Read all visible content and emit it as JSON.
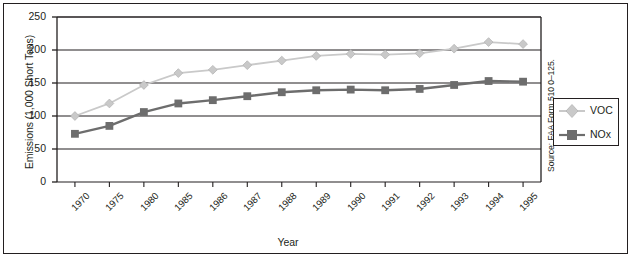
{
  "chart_data": {
    "type": "line",
    "title": "",
    "xlabel": "Year",
    "ylabel": "Emissions (1,000 Short Tons)",
    "categories": [
      "1970",
      "1975",
      "1980",
      "1985",
      "1986",
      "1987",
      "1988",
      "1989",
      "1990",
      "1991",
      "1992",
      "1993",
      "1994",
      "1995"
    ],
    "ylim": [
      0,
      250
    ],
    "yticks": [
      0,
      50,
      100,
      150,
      200,
      250
    ],
    "ytick_labels": [
      "0",
      "50",
      "100",
      "150",
      "200",
      "250"
    ],
    "grid": "horizontal",
    "legend_position": "right-outside",
    "series": [
      {
        "name": "VOC",
        "color": "#c9c9c9",
        "marker": "diamond",
        "values": [
          100,
          119,
          147,
          165,
          170,
          177,
          184,
          191,
          194,
          193,
          195,
          202,
          212,
          209
        ]
      },
      {
        "name": "NOx",
        "color": "#6d6d6d",
        "marker": "square",
        "values": [
          73,
          85,
          106,
          119,
          124,
          130,
          136,
          139,
          140,
          139,
          141,
          147,
          153,
          152
        ]
      }
    ],
    "source_note": "Source: FAA Form 510 0–125."
  },
  "colors": {
    "axis": "#231f20",
    "voc": "#c9c9c9",
    "nox": "#6d6d6d",
    "background": "#ffffff"
  }
}
